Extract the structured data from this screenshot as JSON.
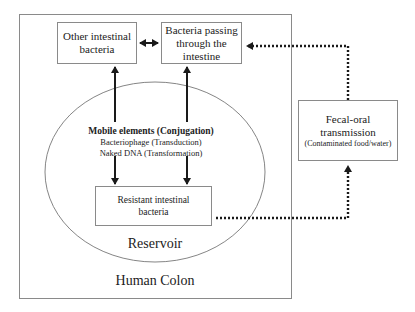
{
  "diagram": {
    "container": {
      "label": "Human Colon"
    },
    "reservoir": {
      "label": "Reservoir"
    },
    "nodes": {
      "other_bacteria": {
        "line1": "Other intestinal",
        "line2": "bacteria"
      },
      "passing_bacteria": {
        "line1": "Bacteria passing",
        "line2": "through the",
        "line3": "intestine"
      },
      "resistant_bacteria": {
        "line1": "Resistant intestinal",
        "line2": "bacteria"
      },
      "fecal_oral": {
        "line1": "Fecal-oral",
        "line2": "transmission",
        "detail": "(Contaminated food/water)"
      }
    },
    "mechanisms": {
      "heading": "Mobile elements (Conjugation)",
      "item1": "Bacteriophage (Transduction)",
      "item2": "Naked DNA (Transformation)"
    },
    "edges": [
      {
        "from": "other_bacteria",
        "to": "passing_bacteria",
        "style": "solid",
        "direction": "both"
      },
      {
        "from": "mechanisms",
        "to": "other_bacteria",
        "style": "solid"
      },
      {
        "from": "mechanisms",
        "to": "passing_bacteria",
        "style": "solid"
      },
      {
        "from": "mechanisms",
        "to": "resistant_bacteria",
        "style": "solid",
        "count": 2
      },
      {
        "from": "resistant_bacteria",
        "to": "fecal_oral",
        "style": "dotted"
      },
      {
        "from": "fecal_oral",
        "to": "passing_bacteria",
        "style": "dotted"
      }
    ],
    "colors": {
      "line": "#1a1a1a",
      "border": "#8a8a8a",
      "ellipse": "#777777"
    }
  }
}
